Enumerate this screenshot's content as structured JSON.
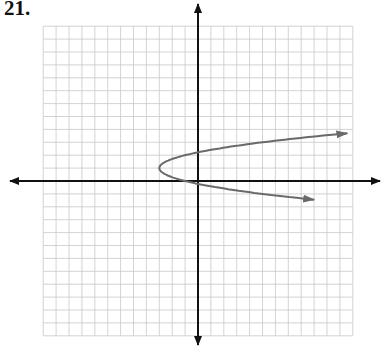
{
  "problem": {
    "number_label": "21."
  },
  "colors": {
    "grid": "#c8c8c8",
    "axis": "#111111",
    "curve": "#6a6a6a",
    "background": "#ffffff"
  },
  "chart_data": {
    "type": "line",
    "title": "21.",
    "xlabel": "",
    "ylabel": "",
    "xlim": [
      -12,
      12
    ],
    "ylim": [
      -12,
      12
    ],
    "grid": true,
    "grid_step": 1,
    "axes_arrows": true,
    "tick_labels": [],
    "legend": [],
    "series": [
      {
        "name": "sideways parabola (opens right)",
        "equation_estimate": "x = 2(y - 1)^2 - 3",
        "vertex": [
          -3,
          1
        ],
        "arrows_at_ends": true,
        "points": [
          [
            11.8,
            3.7
          ],
          [
            9,
            3.4
          ],
          [
            6,
            3.1
          ],
          [
            3,
            2.7
          ],
          [
            0,
            2.2
          ],
          [
            -1,
            2.0
          ],
          [
            -2,
            1.7
          ],
          [
            -3,
            1.0
          ],
          [
            -2,
            0.3
          ],
          [
            -1,
            0.0
          ],
          [
            0,
            -0.2
          ],
          [
            3,
            -0.7
          ],
          [
            6,
            -1.1
          ],
          [
            9,
            -1.45
          ]
        ]
      }
    ]
  }
}
